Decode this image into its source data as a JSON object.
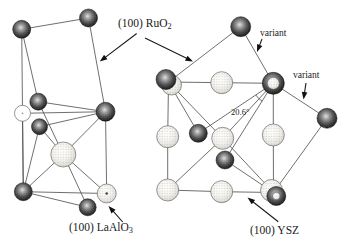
{
  "figure_labels": {
    "ruo2": {
      "main": "(100) RuO",
      "sub": "2"
    },
    "variant_top": "variant",
    "variant_right": "variant",
    "angle": "20.6°",
    "laalo3": {
      "main": "(100) LaAlO",
      "sub": "3"
    },
    "ysz": "(100) YSZ"
  },
  "colors": {
    "background": "#ffffff",
    "line": "#4a4a4a",
    "text": "#1a1a1a"
  },
  "diagram": {
    "atoms": [
      {
        "id": "L1",
        "x": 21.7,
        "y": 29.3,
        "r": 9,
        "type": "dark"
      },
      {
        "id": "L2",
        "x": 88.5,
        "y": 18,
        "r": 9,
        "type": "dark"
      },
      {
        "id": "L3",
        "x": 38.3,
        "y": 101.7,
        "r": 8.5,
        "type": "dark"
      },
      {
        "id": "L4",
        "x": 22.5,
        "y": 113.3,
        "r": 8,
        "type": "white"
      },
      {
        "id": "L5",
        "x": 39.5,
        "y": 126.7,
        "r": 8,
        "type": "dark"
      },
      {
        "id": "L6",
        "x": 105.5,
        "y": 111.7,
        "r": 9.5,
        "type": "dark"
      },
      {
        "id": "L7",
        "x": 63.3,
        "y": 154.5,
        "r": 12.5,
        "type": "light"
      },
      {
        "id": "L8",
        "x": 23.3,
        "y": 191.7,
        "r": 9,
        "type": "dark"
      },
      {
        "id": "L9",
        "x": 87.7,
        "y": 207.3,
        "r": 8.5,
        "type": "dark"
      },
      {
        "id": "L10",
        "x": 106.7,
        "y": 193.5,
        "r": 9.5,
        "type": "lightdot"
      },
      {
        "id": "G1a",
        "x": 168.5,
        "y": 82,
        "r": 0,
        "type": "anchor"
      },
      {
        "id": "G9a",
        "x": 273.5,
        "y": 192.5,
        "r": 0,
        "type": "anchor"
      },
      {
        "id": "G1L",
        "x": 171.5,
        "y": 85,
        "r": 10,
        "type": "light"
      },
      {
        "id": "G1D",
        "x": 166,
        "y": 79.5,
        "r": 10,
        "type": "dark"
      },
      {
        "id": "G2",
        "x": 221.7,
        "y": 82.7,
        "r": 11,
        "type": "light"
      },
      {
        "id": "G4",
        "x": 167.7,
        "y": 136.7,
        "r": 11,
        "type": "light"
      },
      {
        "id": "G5",
        "x": 222.7,
        "y": 138.3,
        "r": 11,
        "type": "light"
      },
      {
        "id": "G6",
        "x": 273.3,
        "y": 135,
        "r": 11,
        "type": "light"
      },
      {
        "id": "G7",
        "x": 167.7,
        "y": 190,
        "r": 11,
        "type": "light"
      },
      {
        "id": "G8",
        "x": 221.7,
        "y": 191.7,
        "r": 11,
        "type": "light"
      },
      {
        "id": "G9L",
        "x": 271.5,
        "y": 190.5,
        "r": 11,
        "type": "light"
      },
      {
        "id": "R1",
        "x": 240.7,
        "y": 26.7,
        "r": 10,
        "type": "dark"
      },
      {
        "id": "R5",
        "x": 327,
        "y": 118.3,
        "r": 10,
        "type": "dark"
      },
      {
        "id": "R6",
        "x": 198.3,
        "y": 133.3,
        "r": 9,
        "type": "dark"
      },
      {
        "id": "R10",
        "x": 225,
        "y": 160,
        "r": 9,
        "type": "dark"
      },
      {
        "id": "G3D",
        "x": 273.3,
        "y": 83.3,
        "r": 11,
        "type": "dark"
      },
      {
        "id": "G3L",
        "x": 273.3,
        "y": 83.3,
        "r": 6,
        "type": "light"
      },
      {
        "id": "G9D",
        "x": 276.3,
        "y": 196,
        "r": 9.5,
        "type": "dark"
      },
      {
        "id": "G9C",
        "x": 276.3,
        "y": 196,
        "r": 3.8,
        "type": "light"
      }
    ],
    "bonds": [
      [
        "L1",
        "L2"
      ],
      [
        "L1",
        "L3"
      ],
      [
        "L2",
        "L6"
      ],
      [
        "L3",
        "L6"
      ],
      [
        "L4",
        "L6"
      ],
      [
        "L5",
        "L6"
      ],
      [
        "L6",
        "L7"
      ],
      [
        "L6",
        "L10"
      ],
      [
        "L1",
        "L8"
      ],
      [
        "L4",
        "L8"
      ],
      [
        "L5",
        "L8"
      ],
      [
        "L5",
        "L7"
      ],
      [
        "L3",
        "L7"
      ],
      [
        "L7",
        "L8"
      ],
      [
        "L7",
        "L9"
      ],
      [
        "L7",
        "L10"
      ],
      [
        "L8",
        "L9"
      ],
      [
        "L8",
        "L10"
      ],
      [
        "G1a",
        "G2"
      ],
      [
        "G2",
        "G3D"
      ],
      [
        "G3D",
        "G6"
      ],
      [
        "G6",
        "G9a"
      ],
      [
        "G9a",
        "G8"
      ],
      [
        "G8",
        "G7"
      ],
      [
        "G7",
        "G4"
      ],
      [
        "G4",
        "G1a"
      ],
      [
        "G1a",
        "G5"
      ],
      [
        "G5",
        "G9a"
      ],
      [
        "G3D",
        "G5"
      ],
      [
        "G5",
        "G7"
      ],
      [
        "G1a",
        "R1"
      ],
      [
        "R1",
        "G3D"
      ],
      [
        "G3D",
        "R6"
      ],
      [
        "R6",
        "G1a"
      ],
      [
        "G3D",
        "R5"
      ],
      [
        "R5",
        "G9a"
      ],
      [
        "G9a",
        "R10"
      ],
      [
        "R10",
        "G3D"
      ]
    ],
    "arrows": [
      {
        "name": "arrow-ruo2-left",
        "from": [
          136.7,
          33.5
        ],
        "to": [
          99.8,
          61.5
        ]
      },
      {
        "name": "arrow-ruo2-right",
        "from": [
          145,
          38
        ],
        "to": [
          193,
          61.5
        ]
      },
      {
        "name": "arrow-variant-top",
        "from": [
          262,
          39
        ],
        "to": [
          257,
          52
        ]
      },
      {
        "name": "arrow-variant-right",
        "from": [
          306,
          83
        ],
        "to": [
          303.5,
          99.5
        ]
      },
      {
        "name": "arrow-laalo3",
        "from": [
          122.7,
          222
        ],
        "to": [
          108.5,
          206
        ]
      },
      {
        "name": "arrow-ysz",
        "from": [
          278.3,
          221.7
        ],
        "to": [
          247.5,
          197.5
        ]
      }
    ],
    "angle_arc": "M255.8 95 A21 21 0 0 0 262.1 101.1"
  }
}
